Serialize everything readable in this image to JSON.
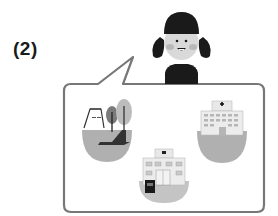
{
  "question": {
    "number_label": "(2)"
  },
  "character": {
    "name": "girl",
    "description": "girl with black hair in pigtails and black shirt, smiling"
  },
  "speech_bubble": {
    "items": [
      {
        "name": "park",
        "icon": "park-icon"
      },
      {
        "name": "hospital",
        "icon": "hospital-icon"
      },
      {
        "name": "school",
        "icon": "school-icon"
      }
    ]
  },
  "colors": {
    "outline": "#777777",
    "dark": "#1a1a1a",
    "ground": "#aaaaaa",
    "light": "#e0e0e0"
  }
}
